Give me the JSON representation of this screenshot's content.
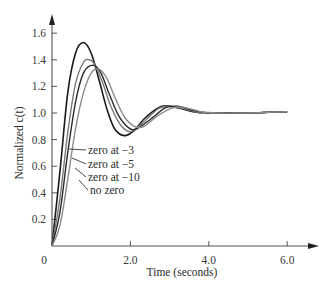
{
  "chart_data": {
    "type": "line",
    "title": "",
    "xlabel": "Time (seconds)",
    "ylabel": "Normalized c(t)",
    "xlim": [
      0,
      6.8
    ],
    "ylim": [
      0,
      1.75
    ],
    "grid": false,
    "legend_position": "inline-annotations",
    "x_ticks": [
      {
        "value": 0,
        "label": "0"
      },
      {
        "value": 2.0,
        "label": "2.0"
      },
      {
        "value": 4.0,
        "label": "4.0"
      },
      {
        "value": 6.0,
        "label": "6.0"
      }
    ],
    "y_ticks": [
      {
        "value": 0.2,
        "label": "0.2"
      },
      {
        "value": 0.4,
        "label": "0.4"
      },
      {
        "value": 0.6,
        "label": "0.6"
      },
      {
        "value": 0.8,
        "label": "0.8"
      },
      {
        "value": 1.0,
        "label": "1.0"
      },
      {
        "value": 1.2,
        "label": "1.2"
      },
      {
        "value": 1.4,
        "label": "1.4"
      },
      {
        "value": 1.6,
        "label": "1.6"
      }
    ],
    "series": [
      {
        "name": "zero at −3",
        "color": "#1a1a1a",
        "x": [
          0,
          0.2,
          0.4,
          0.6,
          0.8,
          1.0,
          1.2,
          1.4,
          1.6,
          1.85,
          2.1,
          2.4,
          2.8,
          3.2,
          3.6,
          4.0,
          5.0,
          6.0
        ],
        "y": [
          0,
          0.55,
          1.15,
          1.45,
          1.53,
          1.45,
          1.25,
          1.03,
          0.88,
          0.83,
          0.87,
          0.97,
          1.05,
          1.04,
          1.01,
          1.0,
          1.0,
          1.01
        ]
      },
      {
        "name": "zero at −5",
        "color": "#7a7a7a",
        "x": [
          0,
          0.2,
          0.4,
          0.6,
          0.8,
          0.95,
          1.1,
          1.3,
          1.5,
          1.75,
          2.0,
          2.3,
          2.7,
          3.0,
          3.4,
          3.8,
          4.2,
          5.0,
          6.0
        ],
        "y": [
          0,
          0.35,
          0.85,
          1.22,
          1.38,
          1.4,
          1.36,
          1.22,
          1.05,
          0.91,
          0.86,
          0.92,
          1.03,
          1.05,
          1.03,
          1.0,
          1.0,
          1.0,
          1.01
        ]
      },
      {
        "name": "zero at −10",
        "color": "#2a2a2a",
        "x": [
          0,
          0.2,
          0.4,
          0.6,
          0.8,
          1.05,
          1.25,
          1.45,
          1.7,
          1.95,
          2.15,
          2.5,
          2.9,
          3.2,
          3.6,
          4.0,
          4.4,
          5.0,
          6.0
        ],
        "y": [
          0,
          0.25,
          0.7,
          1.08,
          1.3,
          1.36,
          1.3,
          1.15,
          0.98,
          0.89,
          0.88,
          0.95,
          1.04,
          1.05,
          1.02,
          1.0,
          1.0,
          1.0,
          1.01
        ]
      },
      {
        "name": "no zero",
        "color": "#8a8a8a",
        "x": [
          0,
          0.2,
          0.4,
          0.6,
          0.8,
          1.0,
          1.2,
          1.4,
          1.6,
          1.85,
          2.1,
          2.35,
          2.7,
          3.1,
          3.4,
          3.8,
          4.2,
          5.0,
          6.0
        ],
        "y": [
          0,
          0.15,
          0.5,
          0.88,
          1.15,
          1.3,
          1.33,
          1.26,
          1.12,
          0.97,
          0.9,
          0.9,
          0.98,
          1.04,
          1.04,
          1.01,
          1.0,
          1.0,
          1.01
        ]
      }
    ],
    "annotations": [
      {
        "text": "zero at −3",
        "series": "zero at −3"
      },
      {
        "text": "zero at −5",
        "series": "zero at −5"
      },
      {
        "text": "zero at −10",
        "series": "zero at −10"
      },
      {
        "text": "no zero",
        "series": "no zero"
      }
    ]
  },
  "axis": {
    "x_title": "Time (seconds)",
    "y_title": "Normalized c(t)",
    "origin_label": "0"
  },
  "legend": [
    {
      "label": "zero at −3"
    },
    {
      "label": "zero at −5"
    },
    {
      "label": "zero at −10"
    },
    {
      "label": "no zero"
    }
  ]
}
